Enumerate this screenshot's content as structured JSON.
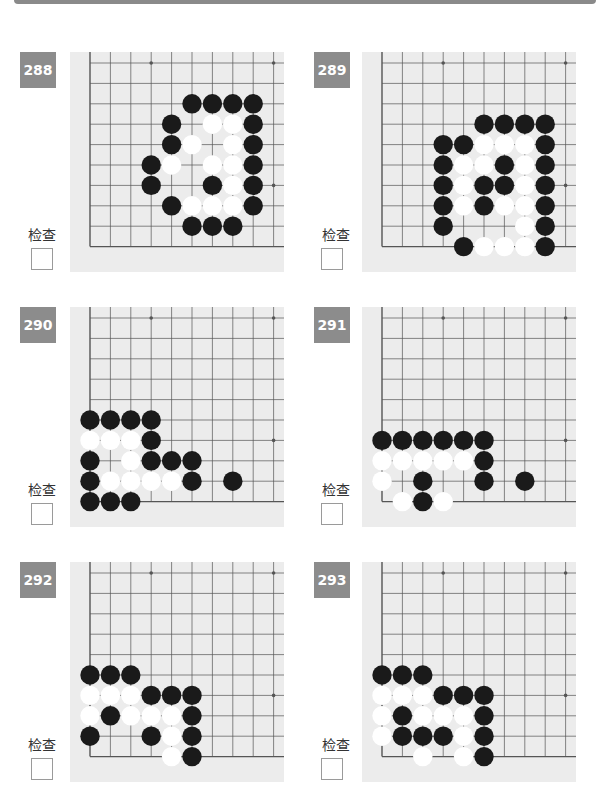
{
  "header": {
    "bar_color": "#8a8a8a"
  },
  "check_label": "检查",
  "colors": {
    "badge": "#8c8c8c",
    "board": "#ececec",
    "grid": "#555555",
    "black": "#1a1a1a",
    "white": "#ffffff"
  },
  "problems": [
    {
      "number": "288",
      "label": "检查",
      "black": [
        [
          5,
          2
        ],
        [
          6,
          2
        ],
        [
          7,
          2
        ],
        [
          8,
          2
        ],
        [
          4,
          3
        ],
        [
          8,
          3
        ],
        [
          4,
          4
        ],
        [
          8,
          4
        ],
        [
          3,
          5
        ],
        [
          8,
          5
        ],
        [
          3,
          6
        ],
        [
          6,
          6
        ],
        [
          8,
          6
        ],
        [
          4,
          7
        ],
        [
          8,
          7
        ],
        [
          5,
          8
        ],
        [
          6,
          8
        ],
        [
          7,
          8
        ]
      ],
      "white": [
        [
          6,
          3
        ],
        [
          7,
          3
        ],
        [
          5,
          4
        ],
        [
          7,
          4
        ],
        [
          4,
          5
        ],
        [
          6,
          5
        ],
        [
          7,
          5
        ],
        [
          7,
          6
        ],
        [
          5,
          7
        ],
        [
          6,
          7
        ],
        [
          7,
          7
        ]
      ]
    },
    {
      "number": "289",
      "label": "检查",
      "black": [
        [
          5,
          3
        ],
        [
          6,
          3
        ],
        [
          7,
          3
        ],
        [
          8,
          3
        ],
        [
          3,
          4
        ],
        [
          4,
          4
        ],
        [
          8,
          4
        ],
        [
          3,
          5
        ],
        [
          6,
          5
        ],
        [
          8,
          5
        ],
        [
          3,
          6
        ],
        [
          5,
          6
        ],
        [
          6,
          6
        ],
        [
          8,
          6
        ],
        [
          3,
          7
        ],
        [
          5,
          7
        ],
        [
          8,
          7
        ],
        [
          3,
          8
        ],
        [
          8,
          8
        ],
        [
          4,
          9
        ],
        [
          8,
          9
        ]
      ],
      "white": [
        [
          5,
          4
        ],
        [
          6,
          4
        ],
        [
          7,
          4
        ],
        [
          4,
          5
        ],
        [
          5,
          5
        ],
        [
          7,
          5
        ],
        [
          4,
          6
        ],
        [
          7,
          6
        ],
        [
          4,
          7
        ],
        [
          6,
          7
        ],
        [
          7,
          7
        ],
        [
          7,
          8
        ],
        [
          5,
          9
        ],
        [
          6,
          9
        ],
        [
          7,
          9
        ]
      ]
    },
    {
      "number": "290",
      "label": "检查",
      "black": [
        [
          0,
          5
        ],
        [
          1,
          5
        ],
        [
          2,
          5
        ],
        [
          3,
          5
        ],
        [
          3,
          6
        ],
        [
          0,
          7
        ],
        [
          3,
          7
        ],
        [
          4,
          7
        ],
        [
          5,
          7
        ],
        [
          0,
          8
        ],
        [
          5,
          8
        ],
        [
          7,
          8
        ],
        [
          0,
          9
        ],
        [
          1,
          9
        ],
        [
          2,
          9
        ]
      ],
      "white": [
        [
          0,
          6
        ],
        [
          1,
          6
        ],
        [
          2,
          6
        ],
        [
          2,
          7
        ],
        [
          1,
          8
        ],
        [
          2,
          8
        ],
        [
          3,
          8
        ],
        [
          4,
          8
        ]
      ]
    },
    {
      "number": "291",
      "label": "检查",
      "black": [
        [
          0,
          6
        ],
        [
          1,
          6
        ],
        [
          2,
          6
        ],
        [
          3,
          6
        ],
        [
          4,
          6
        ],
        [
          5,
          6
        ],
        [
          5,
          7
        ],
        [
          2,
          8
        ],
        [
          5,
          8
        ],
        [
          7,
          8
        ],
        [
          2,
          9
        ]
      ],
      "white": [
        [
          0,
          7
        ],
        [
          1,
          7
        ],
        [
          2,
          7
        ],
        [
          3,
          7
        ],
        [
          4,
          7
        ],
        [
          0,
          8
        ],
        [
          1,
          9
        ],
        [
          3,
          9
        ]
      ]
    },
    {
      "number": "292",
      "label": "检查",
      "black": [
        [
          0,
          5
        ],
        [
          1,
          5
        ],
        [
          2,
          5
        ],
        [
          3,
          6
        ],
        [
          4,
          6
        ],
        [
          5,
          6
        ],
        [
          1,
          7
        ],
        [
          5,
          7
        ],
        [
          0,
          8
        ],
        [
          3,
          8
        ],
        [
          5,
          8
        ],
        [
          5,
          9
        ]
      ],
      "white": [
        [
          0,
          6
        ],
        [
          1,
          6
        ],
        [
          2,
          6
        ],
        [
          0,
          7
        ],
        [
          2,
          7
        ],
        [
          3,
          7
        ],
        [
          4,
          7
        ],
        [
          4,
          8
        ],
        [
          4,
          9
        ]
      ]
    },
    {
      "number": "293",
      "label": "检查",
      "black": [
        [
          0,
          5
        ],
        [
          1,
          5
        ],
        [
          2,
          5
        ],
        [
          3,
          6
        ],
        [
          4,
          6
        ],
        [
          5,
          6
        ],
        [
          1,
          7
        ],
        [
          5,
          7
        ],
        [
          1,
          8
        ],
        [
          2,
          8
        ],
        [
          3,
          8
        ],
        [
          5,
          8
        ],
        [
          5,
          9
        ]
      ],
      "white": [
        [
          0,
          6
        ],
        [
          1,
          6
        ],
        [
          2,
          6
        ],
        [
          0,
          7
        ],
        [
          2,
          7
        ],
        [
          3,
          7
        ],
        [
          4,
          7
        ],
        [
          0,
          8
        ],
        [
          4,
          8
        ],
        [
          2,
          9
        ],
        [
          4,
          9
        ]
      ]
    }
  ]
}
